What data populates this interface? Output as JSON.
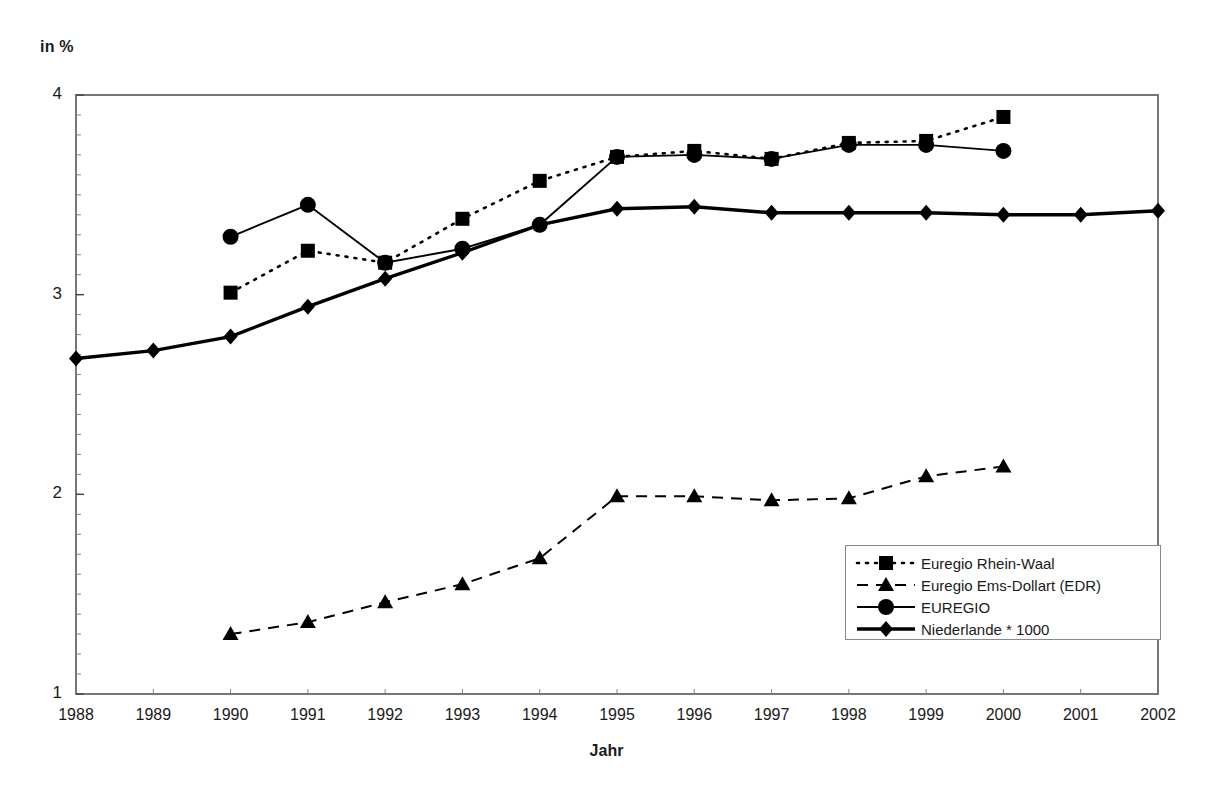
{
  "chart_data": {
    "type": "line",
    "title": "",
    "unit_label": "in %",
    "xlabel": "Jahr",
    "ylabel": "in %",
    "x": [
      1988,
      1989,
      1990,
      1991,
      1992,
      1993,
      1994,
      1995,
      1996,
      1997,
      1998,
      1999,
      2000,
      2001,
      2002
    ],
    "categories": [
      "1988",
      "1989",
      "1990",
      "1991",
      "1992",
      "1993",
      "1994",
      "1995",
      "1996",
      "1997",
      "1998",
      "1999",
      "2000",
      "2001",
      "2002"
    ],
    "xlim": [
      1988,
      2002
    ],
    "ylim": [
      1,
      4
    ],
    "yticks": [
      1,
      2,
      3,
      4
    ],
    "ytick_labels": [
      "1",
      "2",
      "3",
      "4"
    ],
    "grid": false,
    "legend_position": "lower right",
    "series": [
      {
        "name": "Euregio Rhein-Waal",
        "marker": "square",
        "linestyle": "dotted",
        "color": "#000000",
        "x": [
          1990,
          1991,
          1992,
          1993,
          1994,
          1995,
          1996,
          1997,
          1998,
          1999,
          2000
        ],
        "values": [
          3.01,
          3.22,
          3.16,
          3.38,
          3.57,
          3.69,
          3.72,
          3.68,
          3.76,
          3.77,
          3.89
        ]
      },
      {
        "name": "Euregio Ems-Dollart (EDR)",
        "marker": "triangle",
        "linestyle": "dashed",
        "color": "#000000",
        "x": [
          1990,
          1991,
          1992,
          1993,
          1994,
          1995,
          1996,
          1997,
          1998,
          1999,
          2000
        ],
        "values": [
          1.3,
          1.36,
          1.46,
          1.55,
          1.68,
          1.99,
          1.99,
          1.97,
          1.98,
          2.09,
          2.14
        ]
      },
      {
        "name": "EUREGIO",
        "marker": "circle",
        "linestyle": "solid",
        "color": "#000000",
        "x": [
          1990,
          1991,
          1992,
          1993,
          1994,
          1995,
          1996,
          1997,
          1998,
          1999,
          2000
        ],
        "values": [
          3.29,
          3.45,
          3.16,
          3.23,
          3.35,
          3.69,
          3.7,
          3.68,
          3.75,
          3.75,
          3.72
        ]
      },
      {
        "name": "Niederlande * 1000",
        "marker": "diamond",
        "linestyle": "solid-thick",
        "color": "#000000",
        "x": [
          1988,
          1989,
          1990,
          1991,
          1992,
          1993,
          1994,
          1995,
          1996,
          1997,
          1998,
          1999,
          2000,
          2001,
          2002
        ],
        "values": [
          2.68,
          2.72,
          2.79,
          2.94,
          3.08,
          3.21,
          3.35,
          3.43,
          3.44,
          3.41,
          3.41,
          3.41,
          3.4,
          3.4,
          3.42
        ]
      }
    ]
  },
  "legend": {
    "entries": [
      {
        "label": "Euregio Rhein-Waal"
      },
      {
        "label": "Euregio Ems-Dollart (EDR)"
      },
      {
        "label": "EUREGIO"
      },
      {
        "label": "Niederlande * 1000"
      }
    ]
  }
}
